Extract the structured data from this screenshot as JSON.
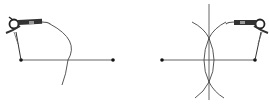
{
  "diagram": {
    "panels": [
      {
        "name": "step-1",
        "segment": {
          "x1": 21,
          "y1": 60,
          "x2": 113,
          "y2": 60
        },
        "arc": {
          "description": "single arc from left endpoint"
        }
      },
      {
        "name": "step-2",
        "segment": {
          "x1": 162,
          "y1": 60,
          "x2": 255,
          "y2": 60
        },
        "bisector_x": 209,
        "intersections": [
          {
            "x": 209,
            "y": 38
          },
          {
            "x": 209,
            "y": 82
          }
        ]
      }
    ],
    "colors": {
      "line": "#555555",
      "point": "#111111",
      "tool": "#333333"
    }
  }
}
